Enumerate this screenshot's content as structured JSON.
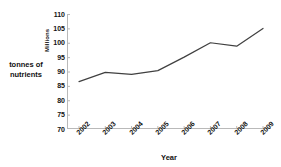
{
  "chart_data": {
    "type": "line",
    "title": "",
    "subtitle": "",
    "xlabel": "Year",
    "ylabel": "Millions",
    "series_label": "tonnes of nutrients",
    "categories": [
      "2002",
      "2003",
      "2004",
      "2005",
      "2006",
      "2007",
      "2008",
      "2009"
    ],
    "values": [
      86.5,
      89.7,
      89.0,
      90.3,
      95.0,
      100.0,
      98.8,
      105.0
    ],
    "series": [
      {
        "name": "tonnes of nutrients",
        "values": [
          86.5,
          89.7,
          89.0,
          90.3,
          95.0,
          100.0,
          98.8,
          105.0
        ],
        "color": "#404040"
      }
    ],
    "ylim": [
      70,
      110
    ],
    "ytick_values": [
      110,
      105,
      100,
      95,
      90,
      85,
      80,
      75,
      70
    ],
    "ytick_labels": [
      "110",
      "105",
      "100",
      "95",
      "90",
      "85",
      "80",
      "75",
      "70"
    ],
    "xtick_labels": [
      "2002",
      "2003",
      "2004",
      "2005",
      "2006",
      "2007",
      "2008",
      "2009"
    ],
    "grid": false,
    "legend": "none",
    "xtick_rotation": -45,
    "line_color": "#404040",
    "axis_color": "#b9b9b9",
    "markers": false
  },
  "axis": {
    "y_title": "Millions",
    "x_title": "Year",
    "left_caption_line1": "tonnes of",
    "left_caption_line2": "nutrients"
  }
}
